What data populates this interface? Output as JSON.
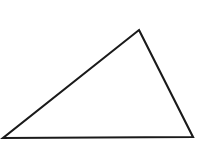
{
  "figure": {
    "type": "geometric-shape",
    "shape_name": "triangle",
    "canvas": {
      "width": 204,
      "height": 151,
      "background_color": "#ffffff"
    },
    "style": {
      "stroke_color": "#1a1a1a",
      "stroke_width": 2.1,
      "fill_color": "#ffffff",
      "stroke_linejoin": "miter"
    },
    "vertices": [
      {
        "name": "apex",
        "x": 139,
        "y": 30
      },
      {
        "name": "bottom-right",
        "x": 193,
        "y": 137
      },
      {
        "name": "bottom-left",
        "x": 3,
        "y": 138
      }
    ],
    "points_attr": "139,30 193,137 3,138",
    "edges": [
      {
        "name": "left-edge",
        "from": "bottom-left",
        "to": "apex"
      },
      {
        "name": "right-edge",
        "from": "apex",
        "to": "bottom-right"
      },
      {
        "name": "base-edge",
        "from": "bottom-right",
        "to": "bottom-left"
      }
    ],
    "labels": []
  }
}
